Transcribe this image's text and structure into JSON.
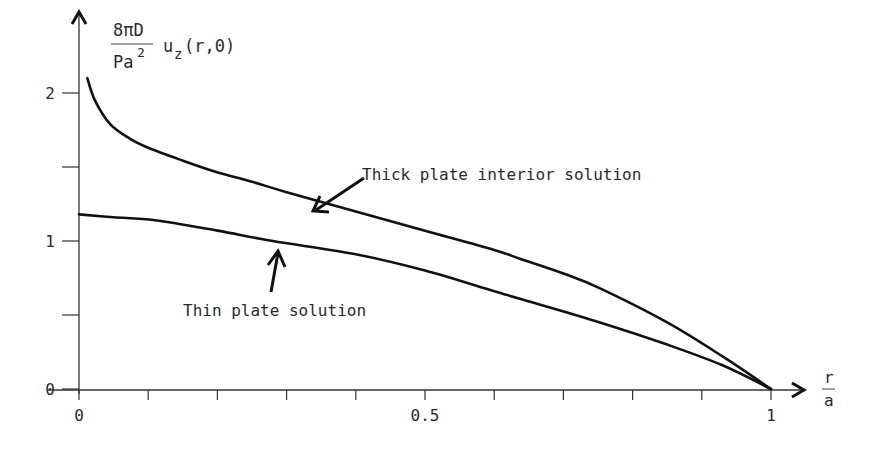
{
  "chart_data": {
    "type": "line",
    "title": "",
    "ylabel": {
      "fraction_numerator": "8πD",
      "fraction_denominator": "Pa",
      "denominator_superscript": "2",
      "function": "u",
      "function_subscript": "z",
      "function_args": "(r,0)"
    },
    "xlabel": {
      "numerator": "r",
      "denominator": "a"
    },
    "xlim": [
      0,
      1
    ],
    "ylim": [
      0,
      2.2
    ],
    "x_ticks": [
      0,
      0.1,
      0.2,
      0.3,
      0.4,
      0.5,
      0.6,
      0.7,
      0.8,
      0.9,
      1.0
    ],
    "x_tick_labels": [
      {
        "value": 0,
        "label": "0"
      },
      {
        "value": 0.5,
        "label": "0.5"
      },
      {
        "value": 1.0,
        "label": "1"
      }
    ],
    "y_ticks": [
      0,
      0.5,
      1,
      1.5,
      2
    ],
    "y_tick_labels": [
      {
        "value": 0,
        "label": "0"
      },
      {
        "value": 1,
        "label": "1"
      },
      {
        "value": 2,
        "label": "2"
      }
    ],
    "grid": false,
    "series": [
      {
        "name": "Thick plate interior solution",
        "x": [
          0.012,
          0.023,
          0.045,
          0.074,
          0.1,
          0.146,
          0.196,
          0.25,
          0.3,
          0.4,
          0.5,
          0.6,
          0.637,
          0.7,
          0.753,
          0.85,
          0.93,
          1.0
        ],
        "y": [
          2.1,
          1.95,
          1.79,
          1.69,
          1.63,
          1.55,
          1.47,
          1.4,
          1.33,
          1.2,
          1.07,
          0.94,
          0.88,
          0.78,
          0.68,
          0.45,
          0.22,
          0.0
        ]
      },
      {
        "name": "Thin plate solution",
        "x": [
          0.0,
          0.05,
          0.11,
          0.2,
          0.28,
          0.4,
          0.5,
          0.6,
          0.637,
          0.753,
          0.85,
          0.93,
          1.0
        ],
        "y": [
          1.18,
          1.16,
          1.14,
          1.07,
          1.0,
          0.91,
          0.8,
          0.66,
          0.61,
          0.45,
          0.3,
          0.16,
          0.0
        ]
      }
    ],
    "annotations": [
      {
        "text": "Thick plate interior solution",
        "points_to_series": "Thick plate interior solution"
      },
      {
        "text": "Thin plate solution",
        "points_to_series": "Thin plate solution"
      }
    ],
    "legend": "none (inline annotations with arrows)"
  },
  "labels": {
    "y_num": "8πD",
    "y_den": "Pa",
    "y_den_sup": "2",
    "y_func": "u",
    "y_sub": "z",
    "y_args": "(r,0)",
    "x_num": "r",
    "x_den": "a",
    "thick": "Thick plate interior solution",
    "thin": "Thin plate solution"
  }
}
